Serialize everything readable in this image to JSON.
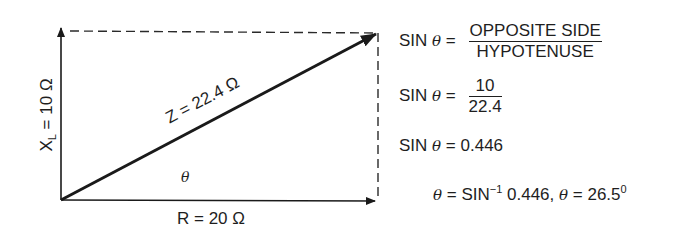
{
  "diagram": {
    "type": "impedance-triangle",
    "reactance_label": "X",
    "reactance_subscript": "L",
    "reactance_value": " = 10 Ω",
    "resistance_label": "R = 20 Ω",
    "impedance_label": "Z = 22.4 Ω",
    "angle_label": "θ",
    "colors": {
      "line": "#1a1a1a",
      "background": "#ffffff"
    }
  },
  "equations": {
    "eq1": {
      "lhs": "SIN",
      "theta": "θ",
      "eq": "=",
      "numerator": "OPPOSITE SIDE",
      "denominator": "HYPOTENUSE"
    },
    "eq2": {
      "lhs": "SIN",
      "theta": "θ",
      "eq": "=",
      "numerator": "10",
      "denominator": "22.4"
    },
    "eq3": {
      "lhs": "SIN",
      "theta": "θ",
      "rhs": "= 0.446"
    },
    "eq4": {
      "theta1": "θ",
      "part1": " = SIN",
      "sup1": "−1",
      "part2": " 0.446, ",
      "theta2": "θ",
      "part3": " = 26.5",
      "sup2": "0"
    }
  }
}
